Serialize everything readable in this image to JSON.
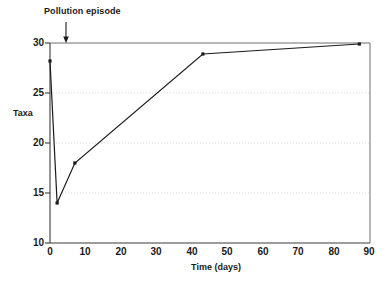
{
  "chart_data": {
    "type": "line",
    "title": "",
    "xlabel": "Time (days)",
    "ylabel": "Taxa",
    "xlim": [
      0,
      90
    ],
    "ylim": [
      10,
      30
    ],
    "xticks": [
      0,
      10,
      20,
      30,
      40,
      50,
      60,
      70,
      80,
      90
    ],
    "xtick_labels": [
      "0",
      "10",
      "20",
      "30",
      "40",
      "50",
      "60",
      "70",
      "80",
      "90"
    ],
    "yticks": [
      10,
      15,
      20,
      25,
      30
    ],
    "ytick_labels": [
      "10",
      "15",
      "20",
      "25",
      "30"
    ],
    "grid": "horizontal-dotted-faint",
    "legend": "none",
    "marker": "square",
    "line_color": "#1a1a1a",
    "grid_color": "#d8d8d8",
    "axis_color": "#555555",
    "series": [
      {
        "name": "Taxa",
        "x": [
          0,
          2,
          7,
          43,
          87
        ],
        "values": [
          28.2,
          14.0,
          18.0,
          28.9,
          29.9
        ]
      }
    ],
    "annotations": [
      {
        "text": "Pollution episode",
        "arrow": "down",
        "points_to_x": 4,
        "points_to_y": 30
      }
    ]
  }
}
